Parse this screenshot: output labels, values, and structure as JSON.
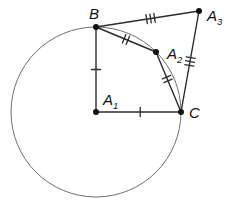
{
  "diagram": {
    "canvas": {
      "width": 228,
      "height": 211,
      "background": "#ffffff"
    },
    "colors": {
      "segment": "#2b2b2b",
      "circle_stroke": "#6e6e6e",
      "point_fill": "#111111",
      "label_text": "#111111"
    },
    "circle": {
      "center": "A1",
      "r": 85
    },
    "points": {
      "B": {
        "x": 96,
        "y": 27,
        "label": "B",
        "sub": "",
        "lx": 89,
        "ly": 19
      },
      "A1": {
        "x": 96,
        "y": 112,
        "label": "A",
        "sub": "1",
        "lx": 103,
        "ly": 105
      },
      "A2": {
        "x": 156,
        "y": 52,
        "label": "A",
        "sub": "2",
        "lx": 167,
        "ly": 59
      },
      "A3": {
        "x": 199,
        "y": 11,
        "label": "A",
        "sub": "3",
        "lx": 207,
        "ly": 21
      },
      "C": {
        "x": 181,
        "y": 112,
        "label": "C",
        "sub": "",
        "lx": 189,
        "ly": 118
      }
    },
    "segments": [
      {
        "from": "B",
        "to": "A1",
        "ticks": 1,
        "at": 0.5
      },
      {
        "from": "A1",
        "to": "C",
        "ticks": 1,
        "at": 0.52
      },
      {
        "from": "B",
        "to": "A2",
        "ticks": 2,
        "at": 0.5
      },
      {
        "from": "A2",
        "to": "C",
        "ticks": 2,
        "at": 0.45
      },
      {
        "from": "B",
        "to": "A3",
        "ticks": 3,
        "at": 0.53
      },
      {
        "from": "A3",
        "to": "C",
        "ticks": 3,
        "at": 0.5
      }
    ],
    "tick_style": {
      "length": 9,
      "spacing": 4,
      "width": 1.3
    },
    "point_radius": 3,
    "label_font_size": 15,
    "subscript_font_size": 9.5,
    "stroke_widths": {
      "segment": 1.4,
      "circle": 1
    }
  }
}
